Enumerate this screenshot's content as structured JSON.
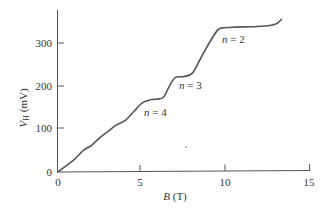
{
  "chart_data": {
    "type": "line",
    "title": "",
    "xlabel": "B (T)",
    "ylabel": "V_H (mV)",
    "xlim": [
      0,
      15
    ],
    "ylim": [
      0,
      370
    ],
    "xticks": [
      0,
      5,
      10,
      15
    ],
    "yticks": [
      0,
      100,
      200,
      300
    ],
    "grid": false,
    "legend": null,
    "series": [
      {
        "name": "Hall voltage",
        "x": [
          0,
          0.5,
          1.0,
          1.5,
          2.0,
          2.5,
          3.0,
          3.5,
          4.0,
          4.5,
          5.0,
          5.5,
          6.0,
          6.3,
          6.7,
          7.0,
          7.5,
          8.0,
          8.5,
          9.0,
          9.5,
          9.8,
          10.5,
          11.5,
          12.5,
          13.0,
          13.3
        ],
        "y": [
          0,
          15,
          30,
          50,
          62,
          80,
          95,
          110,
          120,
          140,
          160,
          168,
          170,
          175,
          205,
          220,
          222,
          230,
          265,
          300,
          330,
          335,
          337,
          338,
          340,
          345,
          355
        ]
      }
    ],
    "annotations": [
      {
        "text": "n = 4",
        "x": 6.2,
        "y": 140
      },
      {
        "text": "n = 3",
        "x": 8.4,
        "y": 200
      },
      {
        "text": "n = 2",
        "x": 10.1,
        "y": 320
      }
    ]
  },
  "axes": {
    "xlabel_italic": "B",
    "xlabel_unit": " (T)",
    "ylabel_italic": "V",
    "ylabel_sub": "H",
    "ylabel_unit": " (mV)",
    "xtick_labels": [
      "0",
      "5",
      "10",
      "15"
    ],
    "ytick_labels": [
      "0",
      "100",
      "200",
      "300"
    ]
  },
  "annotations": {
    "n4_var": "n",
    "n4_val": " = 4",
    "n3_var": "n",
    "n3_val": " = 3",
    "n2_var": "n",
    "n2_val": " = 2"
  },
  "colors": {
    "line": "#555555",
    "text": "#333333",
    "background": "#ffffff"
  }
}
